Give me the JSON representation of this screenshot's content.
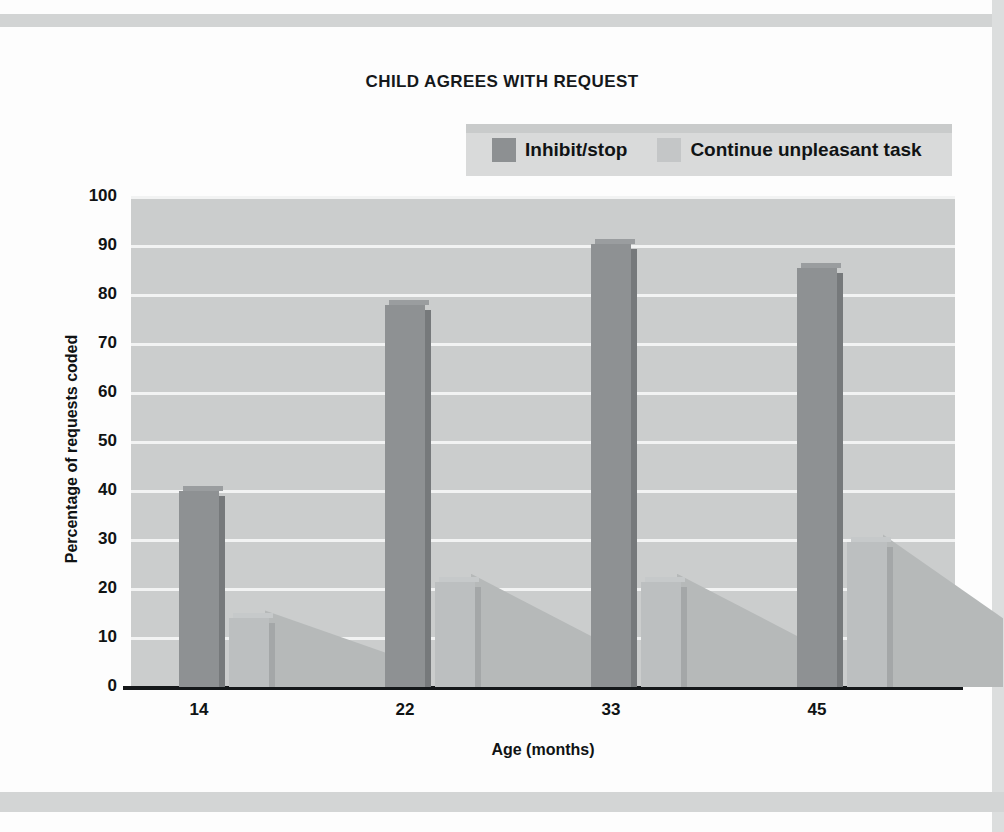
{
  "chart_data": {
    "type": "bar",
    "title": "CHILD AGREES WITH REQUEST",
    "xlabel": "Age (months)",
    "ylabel": "Percentage of requests coded",
    "categories": [
      "14",
      "22",
      "33",
      "45"
    ],
    "series": [
      {
        "name": "Inhibit/stop",
        "values": [
          40,
          78,
          90.5,
          85.5
        ],
        "color": "#8e9193"
      },
      {
        "name": "Continue unpleasant task",
        "values": [
          14,
          21.5,
          21.5,
          29.5
        ],
        "color": "#bcbfc0"
      }
    ],
    "ylim": [
      0,
      100
    ],
    "yticks": [
      "0",
      "10",
      "20",
      "30",
      "40",
      "50",
      "60",
      "70",
      "80",
      "90",
      "100"
    ],
    "grid": true,
    "legend_position": "top-right",
    "plot_background": "#cbcdcd",
    "gridline_color": "#f2f3f3",
    "axis_color": "#15181a"
  },
  "legend": {
    "entries": [
      {
        "label": "Inhibit/stop",
        "swatch": "dark"
      },
      {
        "label": "Continue unpleasant task",
        "swatch": "light"
      }
    ]
  }
}
